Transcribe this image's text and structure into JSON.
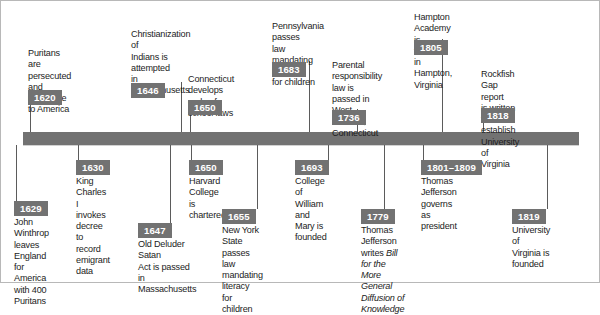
{
  "figure": {
    "bar_color": "#727272",
    "badge_color": "#727272",
    "badge_text_color": "#ffffff",
    "line_color": "#5b5b5b"
  },
  "axis": {
    "x_start": 22,
    "x_end": 578,
    "y_top": 131,
    "height": 13
  },
  "events_above": [
    {
      "year": "1620",
      "text": "Puritans are\npersecuted and\nimmigrate to  America",
      "text_left": 27,
      "text_top": 47,
      "badge_left": 27,
      "badge_top": 88,
      "line_x": 29,
      "line_top": 103,
      "line_bottom": 131
    },
    {
      "year": "1646",
      "text": "Christianization of\nIndians is attempted\nin Massachusetts",
      "text_left": 130,
      "text_top": 28,
      "badge_left": 130,
      "badge_top": 81,
      "line_x": 180,
      "line_top": 81,
      "line_bottom": 131
    },
    {
      "year": "1650",
      "text": "Connecticut develops\ncode of school laws",
      "text_left": 187,
      "text_top": 73,
      "badge_left": 187,
      "badge_top": 98,
      "line_x": 189,
      "line_top": 112,
      "line_bottom": 131
    },
    {
      "year": "1683",
      "text": "Pennsylvania passes\nlaw mandating literacy\nfor children",
      "text_left": 271,
      "text_top": 20,
      "badge_left": 271,
      "badge_top": 60,
      "line_x": 308,
      "line_top": 60,
      "line_bottom": 131
    },
    {
      "year": "1736",
      "text": "Parental responsibility\nlaw is passed in\nWest Hartford,\nConnecticut",
      "text_left": 331,
      "text_top": 59,
      "badge_left": 331,
      "badge_top": 108,
      "line_x": 356,
      "line_top": 108,
      "line_bottom": 131
    },
    {
      "year": "1805",
      "text": "Hampton Academy is\nfounded in Hampton, Virginia",
      "text_left": 413,
      "text_top": 11,
      "badge_left": 413,
      "badge_top": 38,
      "line_x": 441,
      "line_top": 38,
      "line_bottom": 131
    },
    {
      "year": "1818",
      "text": "Rockfish Gap report\nis written to establish\nUniversity of Virginia",
      "text_left": 480,
      "text_top": 68,
      "badge_left": 480,
      "badge_top": 106,
      "line_x": 482,
      "line_top": 120,
      "line_bottom": 131
    }
  ],
  "events_below": [
    {
      "year": "1629",
      "text": "John Winthrop leaves\nEngland for America\nwith 400 Puritans",
      "badge_left": 13,
      "badge_top": 200,
      "text_left": 13,
      "text_top": 215,
      "line_x": 15,
      "line_top": 144,
      "line_bottom": 200
    },
    {
      "year": "1630",
      "text": "King Charles I invokes\ndecree to record\nemigrant data",
      "badge_left": 75,
      "badge_top": 159,
      "text_left": 75,
      "text_top": 174,
      "line_x": 77,
      "line_top": 144,
      "line_bottom": 159
    },
    {
      "year": "1647",
      "text": "Old Deluder Satan\nAct is passed in\nMassachusetts",
      "badge_left": 137,
      "badge_top": 222,
      "text_left": 137,
      "text_top": 237,
      "line_x": 169,
      "line_top": 144,
      "line_bottom": 222
    },
    {
      "year": "1650",
      "text": "Harvard College\nis chartered",
      "badge_left": 188,
      "badge_top": 159,
      "text_left": 188,
      "text_top": 174,
      "line_x": 190,
      "line_top": 144,
      "line_bottom": 159
    },
    {
      "year": "1655",
      "text": "New York State passes\nlaw mandating literacy\nfor children",
      "badge_left": 221,
      "badge_top": 208,
      "text_left": 221,
      "text_top": 223,
      "line_x": 256,
      "line_top": 144,
      "line_bottom": 208
    },
    {
      "year": "1693",
      "text": "College of William\nand Mary is founded",
      "badge_left": 294,
      "badge_top": 159,
      "text_left": 294,
      "text_top": 174,
      "line_x": 327,
      "line_top": 144,
      "line_bottom": 159
    },
    {
      "year": "1779",
      "text_html": "Thomas Jefferson writes <i>Bill</i>\n<i>for the More General</i>\n<i>Diffusion of Knowledge</i>",
      "text": "Thomas Jefferson writes Bill\nfor the More General\nDiffusion of Knowledge",
      "badge_left": 360,
      "badge_top": 208,
      "text_left": 360,
      "text_top": 223,
      "line_x": 383,
      "line_top": 144,
      "line_bottom": 208
    },
    {
      "year": "1801–1809",
      "text": "Thomas Jefferson\ngoverns as president",
      "badge_left": 420,
      "badge_top": 159,
      "text_left": 420,
      "text_top": 174,
      "line_x": 422,
      "line_top": 144,
      "line_bottom": 159
    },
    {
      "year": "1819",
      "text": "University of\nVirginia is\nfounded",
      "badge_left": 511,
      "badge_top": 208,
      "text_left": 511,
      "text_top": 223,
      "line_x": 546,
      "line_top": 144,
      "line_bottom": 208
    }
  ],
  "ticks_above": [
    29,
    180,
    189,
    308,
    356,
    441,
    482
  ],
  "ticks_below": [
    15,
    77,
    169,
    190,
    256,
    327,
    383,
    422,
    546
  ]
}
